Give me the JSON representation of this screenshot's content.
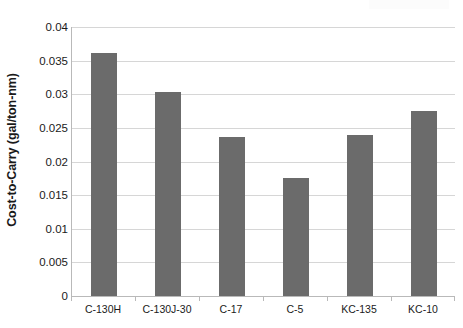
{
  "chart_data": {
    "type": "bar",
    "title": "",
    "xlabel": "",
    "ylabel": "Cost-to-Carry (gal/ton-nm)",
    "categories": [
      "C-130H",
      "C-130J-30",
      "C-17",
      "C-5",
      "KC-135",
      "KC-10"
    ],
    "values": [
      0.0362,
      0.0303,
      0.0236,
      0.0175,
      0.024,
      0.0275
    ],
    "ylim": [
      0,
      0.04
    ],
    "yticks": [
      0,
      0.005,
      0.01,
      0.015,
      0.02,
      0.025,
      0.03,
      0.035,
      0.04
    ],
    "ytick_labels": [
      "0",
      "0.005",
      "0.01",
      "0.015",
      "0.02",
      "0.025",
      "0.03",
      "0.035",
      "0.04"
    ],
    "grid": true,
    "legend": false,
    "legend_position": "none",
    "series": [
      {
        "name": "Cost-to-Carry",
        "color": "#6b6b6b",
        "values": [
          0.0362,
          0.0303,
          0.0236,
          0.0175,
          0.024,
          0.0275
        ]
      }
    ],
    "colors": {
      "bar": "#6b6b6b",
      "gridline": "#d6d6d6",
      "axis": "#b9b9b9",
      "text": "#1a1a1a",
      "background": "#ffffff"
    }
  }
}
